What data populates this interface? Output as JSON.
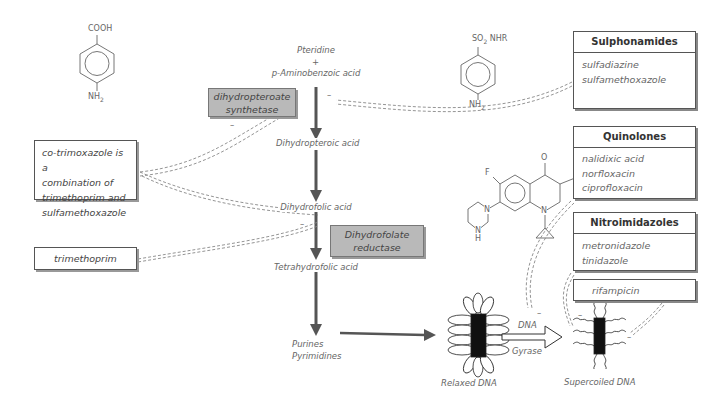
{
  "pathway": {
    "start_line1": "Pteridine",
    "start_plus": "+",
    "start_line2": "p-Aminobenzoic acid",
    "step2": "Dihydropteroic acid",
    "step3": "Dihydrofolic acid",
    "step4": "Tetrahydrofolic acid",
    "step5_line1": "Purines",
    "step5_line2": "Pyrimidines"
  },
  "enzymes": {
    "synthetase_line1": "dihydropteroate",
    "synthetase_line2": "synthetase",
    "reductase_line1": "Dihydrofolate",
    "reductase_line2": "reductase"
  },
  "notes": {
    "cotrimoxazole": [
      "co-trimoxazole is a",
      "combination of",
      "trimethoprim and",
      "sulfamethoxazole"
    ],
    "trimethoprim": "trimethoprim"
  },
  "drug_classes": [
    {
      "name": "Sulphonamides",
      "drugs": [
        "sulfadiazine",
        "sulfamethoxazole"
      ]
    },
    {
      "name": "Quinolones",
      "drugs": [
        "nalidixic acid",
        "norfloxacin",
        "ciprofloxacin"
      ]
    },
    {
      "name": "Nitroimidazoles",
      "drugs": [
        "metronidazole",
        "tinidazole"
      ]
    },
    {
      "name": "",
      "drugs": [
        "rifampicin"
      ]
    }
  ],
  "molecules": {
    "paba_top": "COOH",
    "paba_bottom": "NH",
    "paba_bottom_sub": "2",
    "sulfa_top": "SO",
    "sulfa_top_sub": "2",
    "sulfa_top_rest": " NHR",
    "sulfa_bottom": "NH",
    "sulfa_bottom_sub": "2",
    "quin_o": "O",
    "quin_cooh": "COOH",
    "quin_f": "F",
    "quin_n1": "N",
    "quin_n2": "N",
    "quin_h": "H",
    "quin_n3": "N"
  },
  "dna": {
    "relaxed": "Relaxed DNA",
    "enzyme_line1": "DNA",
    "enzyme_line2": "Gyrase",
    "supercoiled": "Supercoiled DNA"
  },
  "inhibition_sign": "–",
  "colors": {
    "enzyme_fill": "#b9b9b9",
    "arrow": "#555555",
    "line": "#777777"
  }
}
